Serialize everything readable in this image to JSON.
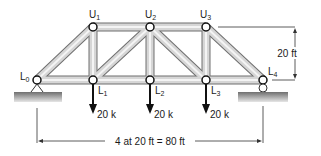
{
  "diagram": {
    "type": "pratt-truss",
    "nodes": {
      "L0": {
        "label": "L",
        "sub": "0"
      },
      "L1": {
        "label": "L",
        "sub": "1"
      },
      "L2": {
        "label": "L",
        "sub": "2"
      },
      "L3": {
        "label": "L",
        "sub": "3"
      },
      "L4": {
        "label": "L",
        "sub": "4"
      },
      "U1": {
        "label": "U",
        "sub": "1"
      },
      "U2": {
        "label": "U",
        "sub": "2"
      },
      "U3": {
        "label": "U",
        "sub": "3"
      }
    },
    "loads": [
      {
        "node": "L1",
        "label": "20 k"
      },
      {
        "node": "L2",
        "label": "20 k"
      },
      {
        "node": "L3",
        "label": "20 k"
      }
    ],
    "height_dimension": "20 ft",
    "span_dimension": "4 at 20 ft = 80 ft",
    "supports": {
      "L0": "pin",
      "L4": "roller"
    },
    "colors": {
      "member_fill": "#c8c8c8",
      "member_edge": "#6e6e6e",
      "ground": "#8a8a8a"
    }
  }
}
